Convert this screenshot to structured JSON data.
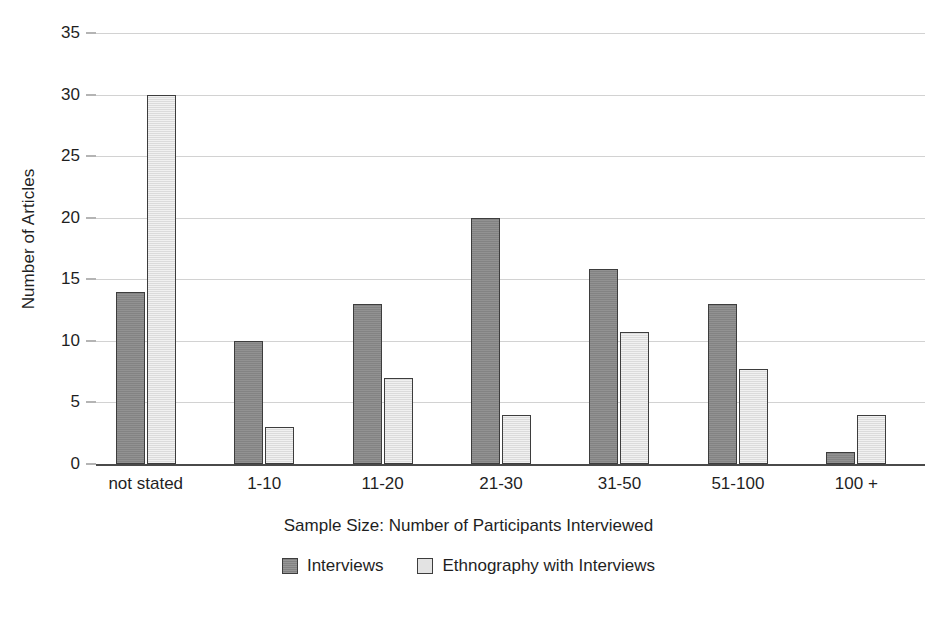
{
  "chart_data": {
    "type": "bar",
    "title": "",
    "subtitle": "",
    "xlabel": "Sample Size: Number of Participants Interviewed",
    "ylabel": "Number of Articles",
    "categories": [
      "not stated",
      "1-10",
      "11-20",
      "21-30",
      "31-50",
      "51-100",
      "100 +"
    ],
    "series": [
      {
        "name": "Interviews",
        "color": "#8a8a8a",
        "values": [
          14,
          10,
          13,
          20,
          15.8,
          13,
          1
        ]
      },
      {
        "name": "Ethnography with Interviews",
        "color": "#e3e3e3",
        "values": [
          30,
          3,
          7,
          4,
          10.7,
          7.7,
          4
        ]
      }
    ],
    "ylim": [
      0,
      35
    ],
    "yticks": [
      0,
      5,
      10,
      15,
      20,
      25,
      30,
      35
    ],
    "ytick_labels": [
      "0",
      "5",
      "10",
      "15",
      "20",
      "25",
      "30",
      "35"
    ],
    "grid": true,
    "grid_axis": "y",
    "legend_position": "bottom-center",
    "bar_style": "grouped"
  },
  "axis": {
    "y_title": "Number of Articles",
    "x_title": "Sample Size: Number of Participants Interviewed"
  },
  "legend": {
    "entries": [
      {
        "label": "Interviews"
      },
      {
        "label": "Ethnography with Interviews"
      }
    ]
  },
  "colors": {
    "series_interviews": "#8a8a8a",
    "series_ethnography": "#e3e3e3",
    "gridline": "#d2d2d2",
    "axis": "#4a4a4a",
    "text": "#1f1f1f",
    "background": "#ffffff"
  }
}
